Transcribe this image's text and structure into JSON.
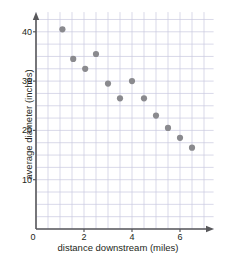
{
  "chart_data": {
    "type": "scatter",
    "title": "",
    "xlabel": "distance downstream (miles)",
    "ylabel": "average diameter (inches)",
    "xlim": [
      0,
      7.4
    ],
    "ylim": [
      0,
      44
    ],
    "xticks": [
      "0",
      "2",
      "4",
      "6"
    ],
    "xtick_values": [
      0,
      2,
      4,
      6
    ],
    "yticks": [
      "10",
      "20",
      "30",
      "40"
    ],
    "ytick_values": [
      10,
      20,
      30,
      40
    ],
    "grid": true,
    "grid_x_step": 0.5,
    "grid_y_step": 2.5,
    "legend": "none",
    "marker": "filled-circle",
    "marker_color": "#8a8a8e",
    "grid_color": "#c9c9e0",
    "axis_color": "#58585b",
    "points": [
      {
        "x": 1.1,
        "y": 40.5
      },
      {
        "x": 1.55,
        "y": 34.5
      },
      {
        "x": 2.05,
        "y": 32.5
      },
      {
        "x": 2.5,
        "y": 35.5
      },
      {
        "x": 3.0,
        "y": 29.5
      },
      {
        "x": 3.5,
        "y": 26.5
      },
      {
        "x": 4.0,
        "y": 30.0
      },
      {
        "x": 4.5,
        "y": 26.5
      },
      {
        "x": 5.0,
        "y": 23.0
      },
      {
        "x": 5.5,
        "y": 20.5
      },
      {
        "x": 6.0,
        "y": 18.5
      },
      {
        "x": 6.5,
        "y": 16.5
      }
    ],
    "x_values": [
      1.1,
      1.55,
      2.05,
      2.5,
      3.0,
      3.5,
      4.0,
      4.5,
      5.0,
      5.5,
      6.0,
      6.5
    ],
    "y_values": [
      40.5,
      34.5,
      32.5,
      35.5,
      29.5,
      26.5,
      30.0,
      26.5,
      23.0,
      20.5,
      18.5,
      16.5
    ]
  }
}
